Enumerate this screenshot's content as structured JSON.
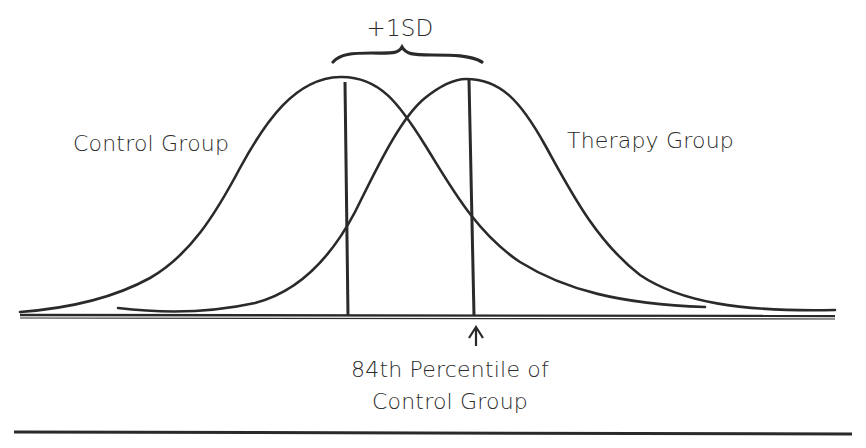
{
  "diagram": {
    "sd_label": "+1SD",
    "curves": [
      {
        "name": "Control Group",
        "label": "Control Group",
        "mean_x_px": 346,
        "peak_y_px": 77
      },
      {
        "name": "Therapy Group",
        "label": "Therapy Group",
        "mean_x_px": 472,
        "peak_y_px": 79
      }
    ],
    "annotation": {
      "line1": "84th Percentile of",
      "line2": "Control Group",
      "arrow": "up-arrow"
    },
    "colors": {
      "ink": "#2a2a2a",
      "background": "#ffffff"
    }
  }
}
